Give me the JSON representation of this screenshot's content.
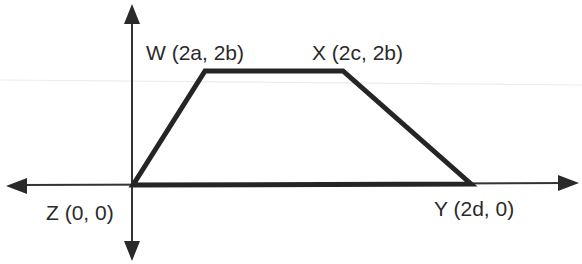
{
  "diagram": {
    "shape": "trapezoid",
    "vertices": [
      {
        "name": "W",
        "coords": "(2a, 2b)",
        "label": "W (2a, 2b)"
      },
      {
        "name": "X",
        "coords": "(2c, 2b)",
        "label": "X (2c, 2b)"
      },
      {
        "name": "Y",
        "coords": "(2d, 0)",
        "label": "Y (2d, 0)"
      },
      {
        "name": "Z",
        "coords": "(0, 0)",
        "label": "Z (0, 0)"
      }
    ],
    "edges": [
      "Z-W",
      "W-X",
      "X-Y",
      "Y-Z"
    ],
    "axes": {
      "x_axis": "double-arrow horizontal",
      "y_axis": "double-arrow vertical"
    },
    "colors": {
      "line": "#222222",
      "axis": "#333333",
      "background": "#ffffff",
      "artifact": "#e6e6e6"
    }
  }
}
